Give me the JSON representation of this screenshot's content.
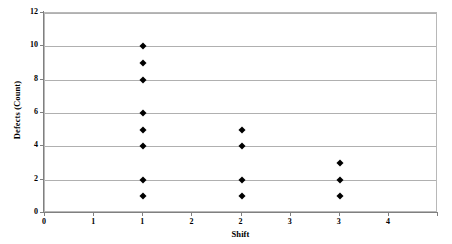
{
  "chart_data": {
    "type": "scatter",
    "title": "",
    "xlabel": "Shift",
    "ylabel": "Defects (Count)",
    "xlim": [
      0,
      4
    ],
    "ylim": [
      0,
      12
    ],
    "grid": "horizontal",
    "legend": "none",
    "marker": "diamond",
    "marker_color": "#000000",
    "gridline_color": "#b0b0b0",
    "plot_border_color": "#b8b8b8",
    "background_color": "#ffffff",
    "y_ticks": [
      {
        "value": 0,
        "label": "0"
      },
      {
        "value": 2,
        "label": "2"
      },
      {
        "value": 4,
        "label": "4"
      },
      {
        "value": 6,
        "label": "6"
      },
      {
        "value": 8,
        "label": "8"
      },
      {
        "value": 10,
        "label": "10"
      },
      {
        "value": 12,
        "label": "12"
      }
    ],
    "x_ticks": [
      {
        "value": 0,
        "label": "0"
      },
      {
        "value": 0.5,
        "label": "1"
      },
      {
        "value": 1,
        "label": "1"
      },
      {
        "value": 1.5,
        "label": "2"
      },
      {
        "value": 2,
        "label": "2"
      },
      {
        "value": 2.5,
        "label": "3"
      },
      {
        "value": 3,
        "label": "3"
      },
      {
        "value": 3.5,
        "label": "4"
      }
    ],
    "series": [
      {
        "name": "Defects by Shift",
        "points": [
          {
            "x": 1,
            "y": 10
          },
          {
            "x": 1,
            "y": 9
          },
          {
            "x": 1,
            "y": 8
          },
          {
            "x": 1,
            "y": 6
          },
          {
            "x": 1,
            "y": 5
          },
          {
            "x": 1,
            "y": 4
          },
          {
            "x": 1,
            "y": 2
          },
          {
            "x": 1,
            "y": 1
          },
          {
            "x": 2,
            "y": 5
          },
          {
            "x": 2,
            "y": 4
          },
          {
            "x": 2,
            "y": 2
          },
          {
            "x": 2,
            "y": 1
          },
          {
            "x": 3,
            "y": 3
          },
          {
            "x": 3,
            "y": 2
          },
          {
            "x": 3,
            "y": 1
          }
        ]
      }
    ]
  }
}
